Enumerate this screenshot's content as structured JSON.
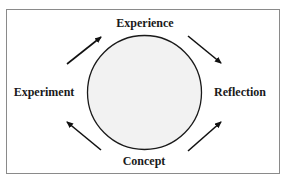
{
  "diagram": {
    "type": "cycle",
    "nodes": [
      {
        "id": "experience",
        "label": "Experience",
        "position": "top"
      },
      {
        "id": "reflection",
        "label": "Reflection",
        "position": "right"
      },
      {
        "id": "concept",
        "label": "Concept",
        "position": "bottom"
      },
      {
        "id": "experiment",
        "label": "Experiment",
        "position": "left"
      }
    ],
    "edges": [
      {
        "from": "experiment",
        "to": "experience",
        "direction": "up-right"
      },
      {
        "from": "experience",
        "to": "reflection",
        "direction": "down-right"
      },
      {
        "from": "reflection",
        "to": "concept",
        "direction": "up-right (pointing toward reflection from concept)"
      },
      {
        "from": "concept",
        "to": "experiment",
        "direction": "up-left"
      }
    ],
    "center_shape": "circle",
    "colors": {
      "circle_fill": "#f2f2f2",
      "circle_stroke": "#1a1a1a",
      "arrow": "#111111",
      "frame_border": "#8a8a8a",
      "text": "#1a1a1a"
    }
  },
  "labels": {
    "top": "Experience",
    "right": "Reflection",
    "bottom": "Concept",
    "left": "Experiment"
  }
}
